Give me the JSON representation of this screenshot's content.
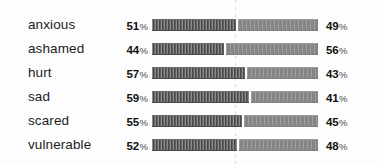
{
  "chart_data": {
    "type": "bar",
    "title": "",
    "xlabel": "",
    "ylabel": "",
    "xlim": [
      0,
      100
    ],
    "grid": false,
    "legend": null,
    "orientation": "horizontal",
    "stacked": true,
    "percent_symbol": "%",
    "midline_value": 50,
    "categories": [
      "anxious",
      "ashamed",
      "hurt",
      "sad",
      "scared",
      "vulnerable"
    ],
    "series": [
      {
        "name": "left",
        "values": [
          51,
          44,
          57,
          59,
          55,
          52
        ]
      },
      {
        "name": "right",
        "values": [
          49,
          56,
          43,
          41,
          45,
          48
        ]
      }
    ],
    "rows": [
      {
        "label": "anxious",
        "left": "51",
        "right": "49"
      },
      {
        "label": "ashamed",
        "left": "44",
        "right": "56"
      },
      {
        "label": "hurt",
        "left": "57",
        "right": "43"
      },
      {
        "label": "sad",
        "left": "59",
        "right": "41"
      },
      {
        "label": "scared",
        "left": "55",
        "right": "45"
      },
      {
        "label": "vulnerable",
        "left": "52",
        "right": "48"
      }
    ],
    "colors": {
      "left_segment": "#5a5a5a",
      "right_segment": "#8d8d8d",
      "midline": "#cfcfcf",
      "label_text": "#1c1c1c",
      "value_text": "#111111",
      "background": "#fdfdfd"
    }
  }
}
